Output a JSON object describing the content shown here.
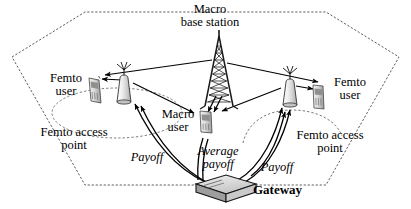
{
  "figure": {
    "background_color": "#ffffff",
    "line_color": "#000000",
    "cell_boundary_color": "#555555",
    "device_fill_color": "#d6d6d6"
  },
  "labels": {
    "macro_base_station": "Macro\nbase station",
    "femto_user_left": "Femto\nuser",
    "femto_access_point_left": "Femto access\npoint",
    "macro_user": "Macro\nuser",
    "femto_user_right": "Femto\nuser",
    "femto_access_point_right": "Femto access\npoint",
    "payoff_left": "Payoff",
    "average_payoff": "Average\npayoff",
    "payoff_right": "Payoff",
    "gateway": "Gateway"
  },
  "nodes": [
    {
      "id": "macro-base-station",
      "name": "Macro base station",
      "type": "tower",
      "x": 219,
      "y": 82
    },
    {
      "id": "femto-access-point-left",
      "name": "Femto access point",
      "type": "access-point",
      "x": 124,
      "y": 95
    },
    {
      "id": "femto-access-point-right",
      "name": "Femto access point",
      "type": "access-point",
      "x": 290,
      "y": 98
    },
    {
      "id": "femto-user-left",
      "name": "Femto user",
      "type": "handset",
      "x": 92,
      "y": 90
    },
    {
      "id": "femto-user-right",
      "name": "Femto user",
      "type": "handset",
      "x": 317,
      "y": 96
    },
    {
      "id": "macro-user",
      "name": "Macro user",
      "type": "handset",
      "x": 204,
      "y": 117
    },
    {
      "id": "gateway",
      "name": "Gateway",
      "type": "box",
      "x": 223,
      "y": 188
    }
  ],
  "links": [
    {
      "from": "macro-base-station",
      "to": "femto-user-left",
      "label": "",
      "style": "arrow"
    },
    {
      "from": "macro-base-station",
      "to": "femto-user-right",
      "label": "",
      "style": "arrow"
    },
    {
      "from": "macro-base-station",
      "to": "macro-user",
      "label": "",
      "style": "arrow"
    },
    {
      "from": "femto-access-point-left",
      "to": "femto-user-left",
      "label": "",
      "style": "arrow"
    },
    {
      "from": "femto-access-point-left",
      "to": "macro-user",
      "label": "",
      "style": "arrow"
    },
    {
      "from": "femto-access-point-right",
      "to": "femto-user-right",
      "label": "",
      "style": "arrow"
    },
    {
      "from": "femto-access-point-right",
      "to": "macro-user",
      "label": "",
      "style": "arrow"
    },
    {
      "from": "gateway",
      "to": "femto-access-point-left",
      "label": "Payoff",
      "style": "curved-arrow"
    },
    {
      "from": "gateway",
      "to": "femto-access-point-right",
      "label": "Payoff",
      "style": "curved-arrow"
    },
    {
      "from": "gateway",
      "to": "macro-user",
      "label": "Average payoff",
      "style": "curved-arrow"
    }
  ]
}
